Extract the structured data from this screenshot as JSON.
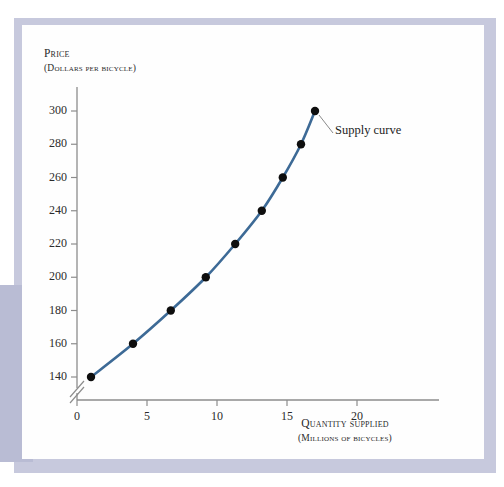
{
  "figure": {
    "background_color": "#fefefe",
    "frame_color": "#c7c9dd",
    "left_band_color": "#b9bcd4"
  },
  "annotation": {
    "supply_curve_label": "Supply curve"
  },
  "axes": {
    "y_title_main": "Price",
    "y_title_sub": "(Dollars per bicycle)",
    "x_title_main": "Quantity supplied",
    "x_title_sub": "(Millions of bicycles)",
    "y_axis_break": true
  },
  "chart_data": {
    "type": "line",
    "title": "",
    "xlabel": "Quantity supplied (millions of bicycles)",
    "ylabel": "Price (dollars per bicycle)",
    "xlim": [
      0,
      23
    ],
    "ylim": [
      130,
      310
    ],
    "y_axis_break_below": 140,
    "grid": false,
    "legend_position": "none",
    "xticks": [
      0,
      5,
      10,
      15,
      20
    ],
    "xtick_labels": [
      "0",
      "5",
      "10",
      "15",
      "20"
    ],
    "yticks": [
      140,
      160,
      180,
      200,
      220,
      240,
      260,
      280,
      300
    ],
    "ytick_labels": [
      "140",
      "160",
      "180",
      "200",
      "220",
      "240",
      "260",
      "280",
      "300"
    ],
    "series": [
      {
        "name": "Supply curve",
        "color": "#3d6a96",
        "marker_color": "#0e0e0e",
        "line_width": 2.6,
        "marker_size": 4.2,
        "x": [
          1,
          4,
          6.7,
          9.2,
          11.3,
          13.2,
          14.7,
          16,
          17
        ],
        "y": [
          140,
          160,
          180,
          200,
          220,
          240,
          260,
          280,
          300
        ]
      }
    ]
  }
}
